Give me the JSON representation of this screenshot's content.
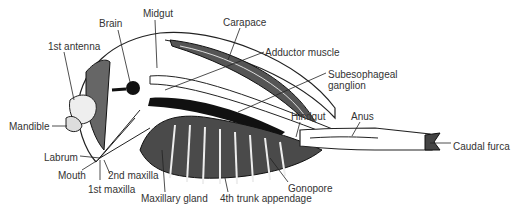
{
  "diagram": {
    "labels": [
      {
        "id": "brain",
        "text": "Brain",
        "x": 99,
        "y": 18
      },
      {
        "id": "midgut",
        "text": "Midgut",
        "x": 143,
        "y": 8
      },
      {
        "id": "carapace",
        "text": "Carapace",
        "x": 223,
        "y": 17
      },
      {
        "id": "first-antenna",
        "text": "1st antenna",
        "x": 48,
        "y": 41
      },
      {
        "id": "adductor-muscle",
        "text": "Adductor muscle",
        "x": 265,
        "y": 47
      },
      {
        "id": "subesophageal-ganglion",
        "text": "Subesophageal",
        "x": 328,
        "y": 69
      },
      {
        "id": "subesophageal-ganglion-2",
        "text": "ganglion",
        "x": 328,
        "y": 80
      },
      {
        "id": "mandible",
        "text": "Mandible",
        "x": 9,
        "y": 121
      },
      {
        "id": "hindgut",
        "text": "Hindgut",
        "x": 291,
        "y": 111
      },
      {
        "id": "anus",
        "text": "Anus",
        "x": 351,
        "y": 111
      },
      {
        "id": "caudal-furca",
        "text": "Caudal furca",
        "x": 453,
        "y": 141
      },
      {
        "id": "labrum",
        "text": "Labrum",
        "x": 44,
        "y": 152
      },
      {
        "id": "mouth",
        "text": "Mouth",
        "x": 58,
        "y": 170
      },
      {
        "id": "second-maxilla",
        "text": "2nd maxilla",
        "x": 108,
        "y": 170
      },
      {
        "id": "first-maxilla",
        "text": "1st maxilla",
        "x": 88,
        "y": 184
      },
      {
        "id": "gonopore",
        "text": "Gonopore",
        "x": 288,
        "y": 183
      },
      {
        "id": "maxillary-gland",
        "text": "Maxillary gland",
        "x": 141,
        "y": 193
      },
      {
        "id": "fourth-trunk-appendage",
        "text": "4th trunk appendage",
        "x": 220,
        "y": 193
      }
    ]
  }
}
